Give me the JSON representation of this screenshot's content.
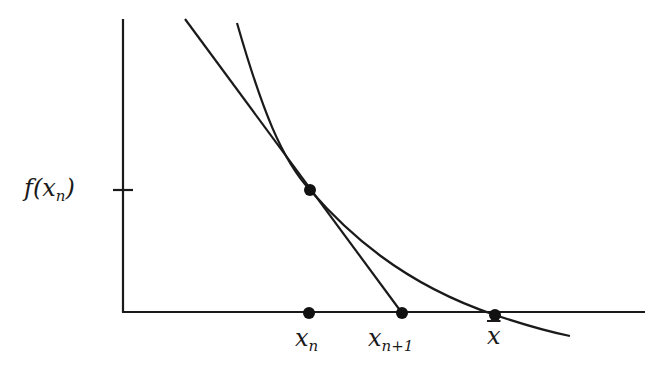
{
  "diagram": {
    "title": "",
    "colors": {
      "stroke": "#1a1a1a",
      "background": "#ffffff"
    },
    "axes": {
      "y_axis": {
        "x": 123,
        "y_top": 19,
        "y_bottom": 312
      },
      "x_axis": {
        "y": 312,
        "x_left": 123,
        "x_right": 645
      },
      "y_tick": {
        "y": 190,
        "x1": 113,
        "x2": 133
      }
    },
    "labels": {
      "f_xn": {
        "main": "f(x",
        "sub": "n",
        "close": ")"
      },
      "xn": {
        "main": "x",
        "sub": "n"
      },
      "xn1": {
        "main": "x",
        "sub": "n+1"
      },
      "xbar": {
        "main": "x"
      }
    },
    "points": [
      {
        "name": "tangent-point",
        "label": "(x_n, f(x_n))",
        "cx": 310,
        "cy": 190
      },
      {
        "name": "xn-point",
        "label": "x_n",
        "cx": 309,
        "cy": 313
      },
      {
        "name": "xn1-point",
        "label": "x_{n+1}",
        "cx": 402,
        "cy": 313
      },
      {
        "name": "root-point",
        "label": "x̄",
        "cx": 495,
        "cy": 315
      }
    ],
    "tangent_line": {
      "x1": 185,
      "y1": 19,
      "x2": 402,
      "y2": 313
    },
    "curve": {
      "path": "M237,23 C262,110 282,160 310,190 C345,230 400,283 495,315 C525,325 550,332 570,336"
    }
  }
}
